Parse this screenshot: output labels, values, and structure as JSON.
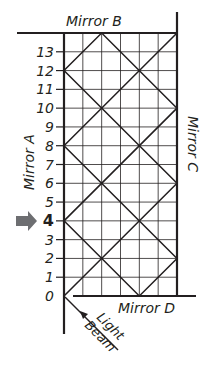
{
  "mirrors": {
    "a": "Mirror A",
    "b": "Mirror B",
    "c": "Mirror C",
    "d": "Mirror D"
  },
  "beam_label_1": "Light",
  "beam_label_2": "Beam",
  "y_ticks": [
    "0",
    "1",
    "2",
    "3",
    "4",
    "5",
    "6",
    "7",
    "8",
    "9",
    "10",
    "11",
    "12",
    "13"
  ],
  "highlighted_tick": "4",
  "grid": {
    "columns": 6,
    "rows": 14
  },
  "beam_path": [
    [
      0,
      0
    ],
    [
      6,
      6
    ],
    [
      0,
      12
    ],
    [
      2,
      14
    ],
    [
      6,
      10
    ],
    [
      0,
      4
    ],
    [
      4,
      0
    ],
    [
      6,
      2
    ],
    [
      0,
      8
    ],
    [
      6,
      14
    ]
  ],
  "colors": {
    "line": "#231f20",
    "grid": "#231f20",
    "arrow": "#6d6e71"
  }
}
